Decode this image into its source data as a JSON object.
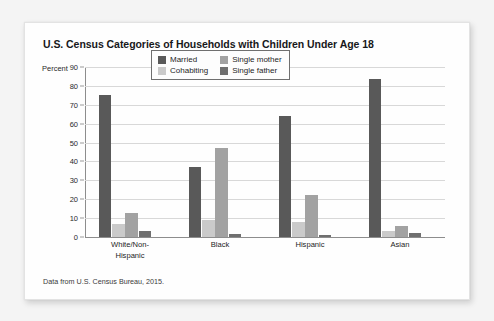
{
  "figure": {
    "title": "U.S. Census Categories of Households with Children Under Age 18",
    "source_note": "Data from U.S. Census Bureau, 2015.",
    "axis_unit_label": "Percent"
  },
  "chart_data": {
    "type": "bar",
    "title": "U.S. Census Categories of Households with Children Under Age 18",
    "xlabel": "",
    "ylabel": "Percent",
    "ylim": [
      0,
      90
    ],
    "ytick_step": 10,
    "yticks": [
      0,
      10,
      20,
      30,
      40,
      50,
      60,
      70,
      80,
      90
    ],
    "ytick_labels": [
      "0",
      "10",
      "20",
      "30",
      "40",
      "50",
      "60",
      "70",
      "80",
      "90"
    ],
    "grid": true,
    "grid_axis": "y",
    "legend_position": "top-center-inside",
    "categories": [
      "White/Non-Hispanic",
      "Black",
      "Hispanic",
      "Asian"
    ],
    "category_label_lines": [
      [
        "White/Non-",
        "Hispanic"
      ],
      [
        "Black"
      ],
      [
        "Hispanic"
      ],
      [
        "Asian"
      ]
    ],
    "series": [
      {
        "name": "Married",
        "color": "#595959",
        "values": [
          75,
          37,
          64,
          83.5
        ]
      },
      {
        "name": "Cohabiting",
        "color": "#cacaca",
        "values": [
          7,
          9,
          8,
          3
        ]
      },
      {
        "name": "Single mother",
        "color": "#a2a2a2",
        "values": [
          12.5,
          47,
          22.5,
          6
        ]
      },
      {
        "name": "Single father",
        "color": "#6f6f6f",
        "values": [
          3,
          1.5,
          1,
          2
        ]
      }
    ],
    "annotations": [
      "Data from U.S. Census Bureau, 2015."
    ]
  },
  "legend": {
    "entries": [
      {
        "label": "Married",
        "color": "#595959"
      },
      {
        "label": "Single mother",
        "color": "#a2a2a2"
      },
      {
        "label": "Cohabiting",
        "color": "#cacaca"
      },
      {
        "label": "Single father",
        "color": "#6f6f6f"
      }
    ]
  },
  "colors": {
    "page_background": "#f4f4f4",
    "card_background": "#fefefe",
    "gridline": "#d8d8d8",
    "axis_line": "#8d8d8d",
    "text": "#232323"
  }
}
